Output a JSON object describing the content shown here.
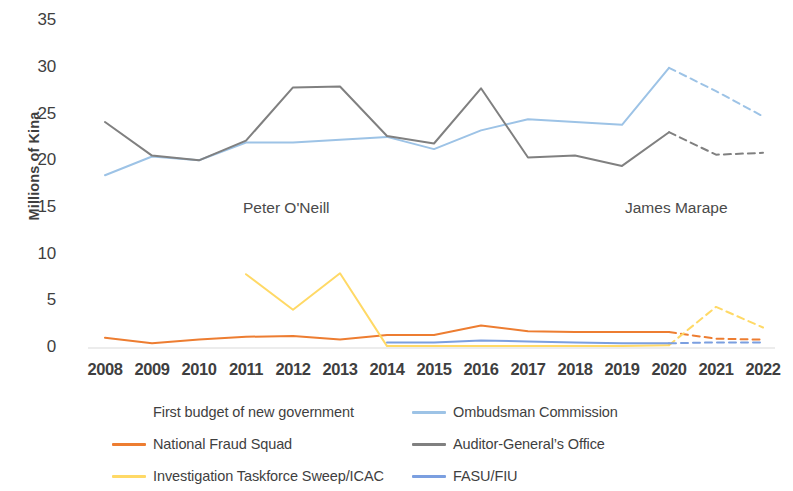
{
  "chart_data": {
    "type": "line",
    "title": "",
    "xlabel": "",
    "ylabel": "Millions of Kina",
    "ylim": [
      0,
      35
    ],
    "yticks": [
      0,
      5,
      10,
      15,
      20,
      25,
      30,
      35
    ],
    "grid": false,
    "legend_position": "bottom",
    "categories": [
      "2008",
      "2009",
      "2010",
      "2011",
      "2012",
      "2013",
      "2014",
      "2015",
      "2016",
      "2017",
      "2018",
      "2019",
      "2020",
      "2021",
      "2022"
    ],
    "annotations": [
      {
        "text": "Peter O'Neill",
        "note": "era label spanning 2011-2019 region"
      },
      {
        "text": "James Marape",
        "note": "era label spanning 2019-2022 region"
      }
    ],
    "dashed_from_year": "2020",
    "dashed_note": "values from 2020 onward are shown as dashed (projected/budget estimates)",
    "series": [
      {
        "name": "Ombudsman Commission",
        "color": "#9DC3E6",
        "values": [
          18.5,
          20.5,
          20.1,
          22.0,
          22.0,
          22.3,
          22.6,
          21.3,
          23.3,
          24.5,
          24.2,
          23.9,
          30.0,
          27.5,
          24.8
        ]
      },
      {
        "name": "Auditor-General's Office",
        "color": "#808080",
        "values": [
          24.2,
          20.6,
          20.1,
          22.2,
          27.9,
          28.0,
          22.7,
          21.9,
          27.8,
          20.4,
          20.6,
          19.5,
          23.1,
          20.7,
          20.9
        ]
      },
      {
        "name": "National Fraud Squad",
        "color": "#ED7D31",
        "values": [
          1.1,
          0.5,
          0.9,
          1.2,
          1.3,
          0.9,
          1.4,
          1.4,
          2.4,
          1.8,
          1.7,
          1.7,
          1.7,
          1.0,
          0.9
        ]
      },
      {
        "name": "Investigation Taskforce Sweep/ICAC",
        "color": "#FFD966",
        "values": [
          null,
          null,
          null,
          7.9,
          4.1,
          8.0,
          0.2,
          0.2,
          0.2,
          0.2,
          0.2,
          0.2,
          0.3,
          4.4,
          2.2
        ]
      },
      {
        "name": "FASU/FIU",
        "color": "#7B9FE0",
        "values": [
          null,
          null,
          null,
          null,
          null,
          null,
          0.6,
          0.6,
          0.8,
          0.7,
          0.6,
          0.5,
          0.5,
          0.6,
          0.6
        ]
      }
    ]
  },
  "axis": {
    "y_title": "Millions of Kina",
    "y_ticks": [
      "35",
      "30",
      "25",
      "20",
      "15",
      "10",
      "5",
      "0"
    ],
    "x_ticks": [
      "2008",
      "2009",
      "2010",
      "2011",
      "2012",
      "2013",
      "2014",
      "2015",
      "2016",
      "2017",
      "2018",
      "2019",
      "2020",
      "2021",
      "2022"
    ]
  },
  "annotations": {
    "peter_oneill": "Peter O'Neill",
    "james_marape": "James Marape"
  },
  "legend": {
    "rows": [
      {
        "left": {
          "label": "First budget of new government",
          "color": "none",
          "has_swatch": false
        },
        "right": {
          "label": "Ombudsman Commission",
          "color": "#9DC3E6",
          "has_swatch": true
        }
      },
      {
        "left": {
          "label": "National Fraud Squad",
          "color": "#ED7D31",
          "has_swatch": true
        },
        "right": {
          "label": "Auditor-General’s Office",
          "color": "#808080",
          "has_swatch": true
        }
      },
      {
        "left": {
          "label": "Investigation Taskforce Sweep/ICAC",
          "color": "#FFD966",
          "has_swatch": true
        },
        "right": {
          "label": "FASU/FIU",
          "color": "#7B9FE0",
          "has_swatch": true
        }
      }
    ]
  },
  "colors": {
    "ombudsman": "#9DC3E6",
    "auditor_general": "#808080",
    "national_fraud_squad": "#ED7D31",
    "icac": "#FFD966",
    "fasu_fiu": "#7B9FE0",
    "axis_line": "#D9D9D9",
    "text": "#3F3F3F"
  }
}
